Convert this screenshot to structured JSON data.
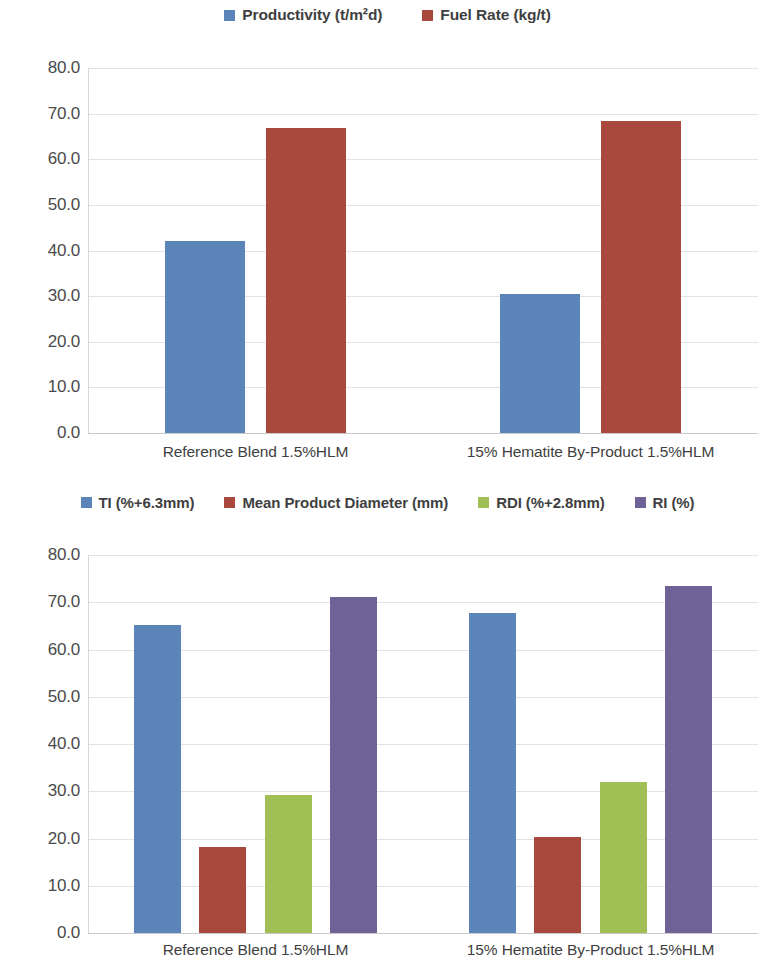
{
  "colors": {
    "series_blue": "#5b84b8",
    "series_red": "#a9483c",
    "series_green": "#a0c055",
    "series_purple": "#6f6296",
    "gridline": "#e2e2e2",
    "axis": "#d6d6d6",
    "text": "#3f3f3f"
  },
  "chart_data": [
    {
      "type": "bar",
      "title": "",
      "xlabel": "",
      "ylabel": "",
      "ylim": [
        0,
        80
      ],
      "ytick_labels": [
        "0.0",
        "10.0",
        "20.0",
        "30.0",
        "40.0",
        "50.0",
        "60.0",
        "70.0",
        "80.0"
      ],
      "ytick_values": [
        0,
        10,
        20,
        30,
        40,
        50,
        60,
        70,
        80
      ],
      "grid": true,
      "legend_position": "top-center",
      "categories": [
        "Reference Blend 1.5%HLM",
        "15% Hematite By-Product 1.5%HLM"
      ],
      "series": [
        {
          "name": "Productivity (t/m²d)",
          "color": "#5b84b8",
          "values": [
            42.1,
            30.5
          ]
        },
        {
          "name": "Fuel Rate (kg/t)",
          "color": "#a9483c",
          "values": [
            66.9,
            68.4
          ]
        }
      ]
    },
    {
      "type": "bar",
      "title": "",
      "xlabel": "",
      "ylabel": "",
      "ylim": [
        0,
        80
      ],
      "ytick_labels": [
        "0.0",
        "10.0",
        "20.0",
        "30.0",
        "40.0",
        "50.0",
        "60.0",
        "70.0",
        "80.0"
      ],
      "ytick_values": [
        0,
        10,
        20,
        30,
        40,
        50,
        60,
        70,
        80
      ],
      "grid": true,
      "legend_position": "top-center",
      "categories": [
        "Reference Blend 1.5%HLM",
        "15% Hematite By-Product 1.5%HLM"
      ],
      "series": [
        {
          "name": "TI (%+6.3mm)",
          "color": "#5b84b8",
          "values": [
            65.2,
            67.7
          ]
        },
        {
          "name": "Mean Product Diameter (mm)",
          "color": "#a9483c",
          "values": [
            18.2,
            20.3
          ]
        },
        {
          "name": "RDI (%+2.8mm)",
          "color": "#a0c055",
          "values": [
            29.2,
            31.9
          ]
        },
        {
          "name": "RI (%)",
          "color": "#6f6296",
          "values": [
            71.1,
            73.4
          ]
        }
      ]
    }
  ]
}
